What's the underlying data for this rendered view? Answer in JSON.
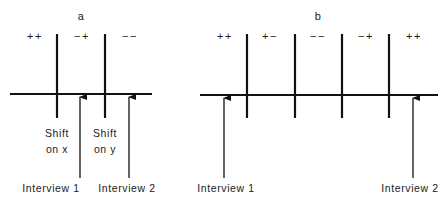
{
  "panels": [
    {
      "id": "a",
      "title": "a",
      "regions": [
        "++",
        "−+",
        "−−"
      ],
      "shift_labels": [
        {
          "line1": "Shift",
          "line2": "on x"
        },
        {
          "line1": "Shift",
          "line2": "on y"
        }
      ],
      "interviews": [
        "Interview 1",
        "Interview 2"
      ]
    },
    {
      "id": "b",
      "title": "b",
      "regions": [
        "++",
        "+−",
        "−−",
        "−+",
        "++"
      ],
      "interviews": [
        "Interview 1",
        "Interview 2"
      ]
    }
  ],
  "colors": {
    "ink": "#111111",
    "background": "#ffffff"
  }
}
